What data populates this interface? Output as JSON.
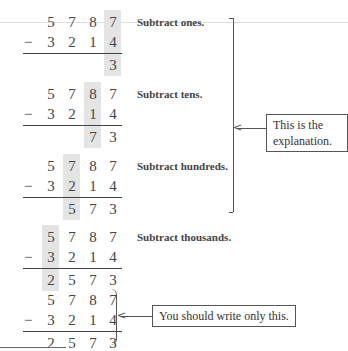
{
  "problem": {
    "top": [
      "5",
      "7",
      "8",
      "7"
    ],
    "bottom": [
      "3",
      "2",
      "1",
      "4"
    ],
    "operator": "−"
  },
  "steps": [
    {
      "label": "Subtract ones.",
      "result": [
        "",
        "",
        "",
        "3"
      ],
      "highlight_col": 3
    },
    {
      "label": "Subtract tens.",
      "result": [
        "",
        "",
        "7",
        "3"
      ],
      "highlight_col": 2
    },
    {
      "label": "Subtract hundreds.",
      "result": [
        "",
        "5",
        "7",
        "3"
      ],
      "highlight_col": 1
    },
    {
      "label": "Subtract thousands.",
      "result": [
        "2",
        "5",
        "7",
        "3"
      ],
      "highlight_col": 0
    }
  ],
  "final": {
    "result": [
      "2",
      "5",
      "7",
      "3"
    ]
  },
  "callouts": {
    "explanation_line1": "This is the",
    "explanation_line2": "explanation.",
    "write_only": "You should write only this."
  },
  "colors": {
    "highlight": "#e4e4e4",
    "text": "#444444"
  }
}
